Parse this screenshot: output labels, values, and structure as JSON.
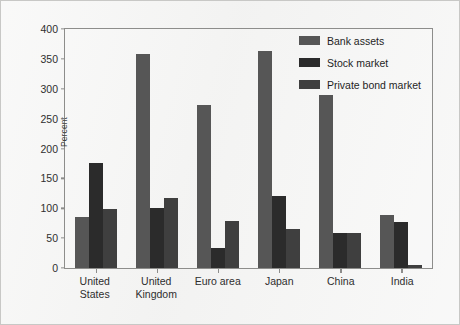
{
  "chart_data": {
    "type": "bar",
    "title": "",
    "subtitle": "",
    "xlabel": "",
    "ylabel": "Percent",
    "ylim": [
      0,
      400
    ],
    "yticks": [
      0,
      50,
      100,
      150,
      200,
      250,
      300,
      350,
      400
    ],
    "grid": false,
    "legend_position": "top-right",
    "categories": [
      "United States",
      "United Kingdom",
      "Euro area",
      "Japan",
      "China",
      "India"
    ],
    "category_lines": [
      [
        "United",
        "States"
      ],
      [
        "United",
        "Kingdom"
      ],
      [
        "Euro area"
      ],
      [
        "Japan"
      ],
      [
        "China"
      ],
      [
        "India"
      ]
    ],
    "series": [
      {
        "name": "Bank assets",
        "color": "#565656",
        "values": [
          86,
          358,
          272,
          363,
          290,
          89
        ]
      },
      {
        "name": "Stock market",
        "color": "#2b2b2b",
        "values": [
          176,
          101,
          33,
          120,
          59,
          77
        ]
      },
      {
        "name": "Private bond market",
        "color": "#3f3f3f",
        "values": [
          99,
          118,
          78,
          65,
          58,
          5
        ]
      }
    ]
  },
  "colors": {
    "figure_background": "#f2f2f1",
    "figure_border": "#c8c8c6",
    "axis_line": "#8d8d8b",
    "text": "#2e2e2e"
  }
}
